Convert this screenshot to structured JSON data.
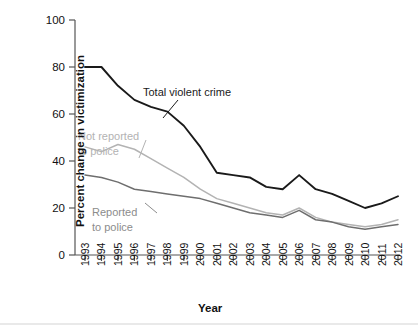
{
  "chart_data": {
    "type": "line",
    "title": "",
    "xlabel": "Year",
    "ylabel": "Percent change in victimization",
    "ylim": [
      0,
      100
    ],
    "yticks": [
      0,
      20,
      40,
      60,
      80,
      100
    ],
    "grid": false,
    "legend_position": "inline-annotations",
    "categories": [
      "1993",
      "1994",
      "1995",
      "1996",
      "1997",
      "1998",
      "1999",
      "2000",
      "2001",
      "2002",
      "2003",
      "2004",
      "2005",
      "2006",
      "2007",
      "2008",
      "2009",
      "2010",
      "2011",
      "2012"
    ],
    "series": [
      {
        "name": "Total violent crime",
        "color": "#1a1a1a",
        "values": [
          80,
          80,
          72,
          66,
          63,
          61,
          55,
          46,
          35,
          34,
          33,
          29,
          28,
          34,
          28,
          26,
          23,
          20,
          22,
          25
        ]
      },
      {
        "name": "Not reported to police",
        "color": "#b3b3b3",
        "values": [
          46,
          44,
          47,
          45,
          41,
          37,
          33,
          28,
          24,
          22,
          20,
          18,
          17,
          20,
          16,
          14,
          13,
          12,
          13,
          15
        ]
      },
      {
        "name": "Reported to police",
        "color": "#6e6e6e",
        "values": [
          34,
          33,
          31,
          28,
          27,
          26,
          25,
          24,
          22,
          20,
          18,
          17,
          16,
          19,
          15,
          14,
          12,
          11,
          12,
          13
        ]
      }
    ],
    "annotations": [
      {
        "text": "Total violent crime",
        "series": "Total violent crime",
        "color": "#1a1a1a"
      },
      {
        "text": "Not reported",
        "series": "Not reported to police",
        "color": "#b3b3b3"
      },
      {
        "text": "to police",
        "series": "Not reported to police",
        "color": "#b3b3b3"
      },
      {
        "text": "Reported",
        "series": "Reported to police",
        "color": "#8c8c8c"
      },
      {
        "text": "to police",
        "series": "Reported to police",
        "color": "#8c8c8c"
      }
    ]
  },
  "axes": {
    "y_tick_labels": [
      "100",
      "80",
      "60",
      "40",
      "20",
      "0"
    ],
    "x_tick_labels": [
      "1993",
      "1994",
      "1995",
      "1996",
      "1997",
      "1998",
      "1999",
      "2000",
      "2001",
      "2002",
      "2003",
      "2004",
      "2005",
      "2006",
      "2007",
      "2008",
      "2009",
      "2010",
      "2011",
      "2012"
    ],
    "y_axis_title": "Percent change in victimization",
    "x_axis_title": "Year"
  },
  "labels": {
    "total_violent_crime": "Total violent crime",
    "not_reported_line1": "Not reported",
    "not_reported_line2": "to police",
    "reported_line1": "Reported",
    "reported_line2": "to police"
  }
}
